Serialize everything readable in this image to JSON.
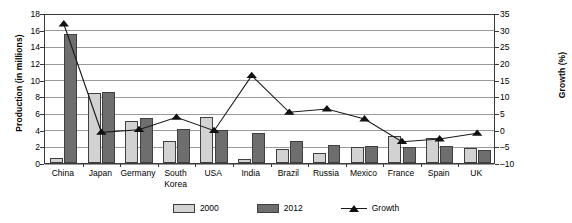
{
  "chart_data": {
    "type": "bar",
    "title": "",
    "xlabel": "",
    "ylabel": "Production (in millions)",
    "y2label": "Growth (%)",
    "categories": [
      "China",
      "Japan",
      "Germany",
      "South Korea",
      "USA",
      "India",
      "Brazil",
      "Russia",
      "Mexico",
      "France",
      "Spain",
      "UK"
    ],
    "series": [
      {
        "name": "2000",
        "axis": "left",
        "type": "bar",
        "color": "#d2d2d2",
        "values": [
          0.6,
          8.4,
          5.1,
          2.6,
          5.5,
          0.5,
          1.7,
          1.2,
          1.9,
          3.3,
          3.0,
          1.8
        ]
      },
      {
        "name": "2012",
        "axis": "left",
        "type": "bar",
        "color": "#6e6e6e",
        "values": [
          15.5,
          8.5,
          5.4,
          4.1,
          4.0,
          3.6,
          2.6,
          2.2,
          2.0,
          1.9,
          2.0,
          1.6
        ]
      },
      {
        "name": "Growth",
        "axis": "right",
        "type": "line",
        "color": "#111111",
        "values": [
          32.0,
          -0.5,
          0.3,
          4.0,
          0.0,
          16.5,
          5.5,
          6.5,
          3.5,
          -3.3,
          -2.5,
          -0.8
        ]
      }
    ],
    "ylim": [
      0,
      18
    ],
    "yticks": [
      0,
      2,
      4,
      6,
      8,
      10,
      12,
      14,
      16,
      18
    ],
    "y2lim": [
      -10,
      35
    ],
    "y2ticks": [
      -10,
      -5,
      0,
      5,
      10,
      15,
      20,
      25,
      30,
      35
    ],
    "grid": true,
    "legend_position": "bottom",
    "legend_entries": [
      "2000",
      "2012",
      "Growth"
    ]
  },
  "legend": {
    "item_2000": "2000",
    "item_2012": "2012",
    "item_growth": "Growth"
  },
  "axes": {
    "left_title": "Production (in millions)",
    "right_title": "Growth (%)"
  }
}
